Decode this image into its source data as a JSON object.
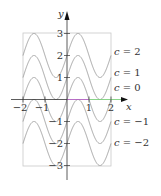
{
  "chart_data": {
    "type": "line",
    "title": "",
    "function": "y = sin(pi*x) + c",
    "xlabel": "x",
    "ylabel": "y",
    "xlim": [
      -2,
      2
    ],
    "ylim": [
      -3,
      3
    ],
    "x_ticks": [
      -2,
      -1,
      1,
      2
    ],
    "x_tick_labels": [
      "−2",
      "−1",
      "1",
      "2"
    ],
    "y_ticks": [
      3,
      2,
      1,
      -1,
      -2,
      -3
    ],
    "y_tick_labels": [
      "3",
      "2",
      "1",
      "−1",
      "−2",
      "−3"
    ],
    "grid": false,
    "frame_box": true,
    "series": [
      {
        "name": "c = 2",
        "c": 2
      },
      {
        "name": "c = 1",
        "c": 1
      },
      {
        "name": "c = 0",
        "c": 0
      },
      {
        "name": "c = −1",
        "c": -1
      },
      {
        "name": "c = −2",
        "c": -2
      }
    ],
    "curve_labels": [
      {
        "text": "c = 2",
        "c": 2
      },
      {
        "text": "c = 1",
        "c": 1
      },
      {
        "text": "c = 0",
        "c": 0
      },
      {
        "text": "c = −1",
        "c": -1
      },
      {
        "text": "c = −2",
        "c": -2
      }
    ],
    "colors": {
      "curve": "#9a9a9a",
      "frame": "#c8c8c8",
      "axis": "#333333",
      "x_axis_highlight_purple": "#b060c0",
      "x_axis_highlight_green": "#7ccf7c"
    }
  }
}
